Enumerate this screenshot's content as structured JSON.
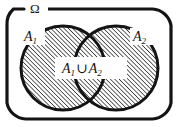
{
  "figure": {
    "type": "venn-diagram",
    "universe_label": "Ω",
    "set_a_label_text": "A",
    "set_a_label_sub": "1",
    "set_b_label_text": "A",
    "set_b_label_sub": "2",
    "union_label": {
      "first_set": "A",
      "first_sub": "1",
      "operator": "∪",
      "second_set": "A",
      "second_sub": "2"
    },
    "colors": {
      "ink": "#141414",
      "background": "#ffffff",
      "hatch": "#141414",
      "fill": "#ffffff"
    },
    "shading": {
      "region": "A1 ∪ A2",
      "pattern": "diagonal-hatch",
      "direction": "rising-left-to-right",
      "spacing_px": 3.1,
      "stroke_width_px": 1.25
    },
    "geometry": {
      "frame": {
        "shape": "rounded-rectangle",
        "x": 7,
        "y": 9,
        "width": 164,
        "height": 110,
        "radius": 20,
        "stroke_width": 3.2,
        "top_gap_start_x": 24,
        "top_gap_end_x": 47
      },
      "circle_left": {
        "cx": 63,
        "cy": 68,
        "r": 42
      },
      "circle_right": {
        "cx": 116,
        "cy": 68,
        "r": 42
      },
      "label_box": {
        "x": 55,
        "y": 57,
        "width": 72,
        "height": 22
      }
    }
  }
}
